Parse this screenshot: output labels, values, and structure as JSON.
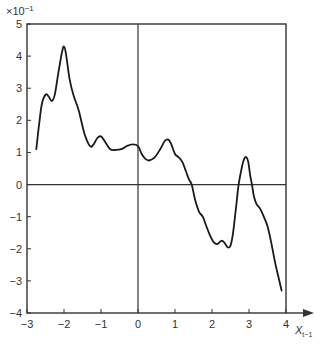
{
  "chart_data": {
    "type": "line",
    "title": "",
    "xlabel": "X_{t-1}",
    "xlabel_main": "X",
    "xlabel_sub": "t−1",
    "ylabel": "",
    "y_scale_label": "×10⁻¹",
    "y_scale_base": "×10",
    "y_scale_exp": "−1",
    "xlim": [
      -3,
      4
    ],
    "ylim": [
      -4,
      5
    ],
    "x_ticks": [
      -3,
      -2,
      -1,
      0,
      1,
      2,
      3,
      4
    ],
    "x_tick_labels": [
      "−3",
      "−2",
      "−1",
      "0",
      "1",
      "2",
      "3",
      "4"
    ],
    "y_ticks": [
      -4,
      -3,
      -2,
      -1,
      0,
      1,
      2,
      3,
      4,
      5
    ],
    "y_tick_labels": [
      "−4",
      "−3",
      "−2",
      "−1",
      "0",
      "1",
      "2",
      "3",
      "4",
      "5"
    ],
    "grid": false,
    "reference_lines": {
      "horizontal_zero": true,
      "vertical_zero": true
    },
    "legend": null,
    "series": [
      {
        "name": "estimated function",
        "x": [
          -2.75,
          -2.68,
          -2.6,
          -2.5,
          -2.42,
          -2.33,
          -2.25,
          -2.15,
          -2.05,
          -2.0,
          -1.95,
          -1.85,
          -1.75,
          -1.6,
          -1.45,
          -1.3,
          -1.2,
          -1.1,
          -1.0,
          -0.9,
          -0.75,
          -0.6,
          -0.45,
          -0.3,
          -0.15,
          0.0,
          0.1,
          0.2,
          0.3,
          0.45,
          0.6,
          0.72,
          0.82,
          0.9,
          1.0,
          1.1,
          1.2,
          1.3,
          1.38,
          1.45,
          1.55,
          1.65,
          1.75,
          1.85,
          1.95,
          2.05,
          2.15,
          2.25,
          2.33,
          2.42,
          2.5,
          2.57,
          2.65,
          2.72,
          2.8,
          2.87,
          2.93,
          2.98,
          3.03,
          3.08,
          3.13,
          3.2,
          3.3,
          3.4,
          3.5,
          3.6,
          3.7,
          3.8,
          3.88
        ],
        "y": [
          1.1,
          1.8,
          2.5,
          2.8,
          2.75,
          2.6,
          2.8,
          3.5,
          4.15,
          4.3,
          4.1,
          3.3,
          2.8,
          2.3,
          1.6,
          1.2,
          1.25,
          1.45,
          1.5,
          1.35,
          1.1,
          1.08,
          1.1,
          1.2,
          1.25,
          1.2,
          0.95,
          0.8,
          0.75,
          0.85,
          1.1,
          1.35,
          1.4,
          1.25,
          0.95,
          0.85,
          0.7,
          0.4,
          0.15,
          0.0,
          -0.5,
          -0.85,
          -1.0,
          -1.3,
          -1.6,
          -1.8,
          -1.85,
          -1.75,
          -1.8,
          -1.95,
          -1.9,
          -1.5,
          -0.7,
          0.0,
          0.5,
          0.8,
          0.85,
          0.7,
          0.3,
          0.0,
          -0.35,
          -0.6,
          -0.75,
          -1.0,
          -1.3,
          -1.8,
          -2.4,
          -2.9,
          -3.3
        ],
        "color": "#1a1a1a"
      }
    ]
  }
}
